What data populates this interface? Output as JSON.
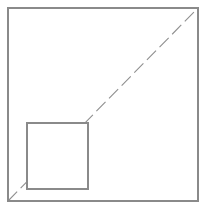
{
  "figure": {
    "canvas": {
      "width": 210,
      "height": 212,
      "background_color": "#ffffff"
    },
    "shapes": {
      "outer_square": {
        "name": "outer-square",
        "x": 8,
        "y": 8,
        "width": 190,
        "height": 193,
        "stroke_color": "#8a8a8a",
        "stroke_width": 1.1,
        "fill_color": "none"
      },
      "inner_square": {
        "name": "inner-square",
        "x": 27,
        "y": 123,
        "width": 61,
        "height": 66,
        "stroke_color": "#8a8a8a",
        "stroke_width": 1.1,
        "fill_color": "#ffffff"
      },
      "diagonal_line": {
        "name": "dashed-diagonal",
        "x1": 8,
        "y1": 201,
        "x2": 198,
        "y2": 8,
        "stroke_color": "#8f8f8f",
        "stroke_width": 1.1,
        "dash_length": 13,
        "gap_length": 5,
        "style": "dashed",
        "description": "dashed line from bottom-left corner to top-right corner of outer square"
      }
    }
  }
}
